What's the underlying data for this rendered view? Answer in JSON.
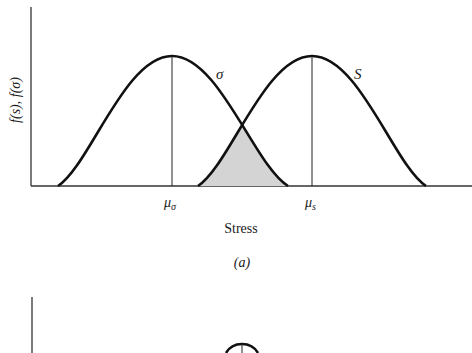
{
  "panel_a": {
    "y_axis_label": "f(s), f(σ)",
    "x_axis_label": "Stress",
    "caption": "(a)",
    "curve_stress": {
      "label": "σ",
      "mean_label_main": "μ",
      "mean_label_sub": "σ"
    },
    "curve_strength": {
      "label": "S",
      "mean_label_main": "μ",
      "mean_label_sub": "s"
    },
    "overlap_region": "interference area (shaded)",
    "colors": {
      "line": "#111111",
      "shade": "#d4d4d4",
      "axis": "#333333"
    }
  },
  "panel_b": {
    "partial": true
  }
}
